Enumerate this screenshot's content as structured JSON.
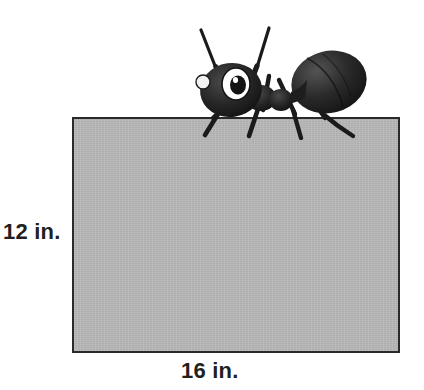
{
  "figure": {
    "name": "ant-on-rectangle-area-problem",
    "background_color": "#ffffff"
  },
  "rectangle": {
    "fill_color": "#b7b7b7",
    "stroke_color": "#2a2a2a",
    "stroke_width_px": 2,
    "x_px": 72,
    "y_px": 117,
    "width_px": 328,
    "height_px": 236
  },
  "labels": {
    "height": "12 in.",
    "width": "16 in.",
    "text_color": "#231f20"
  },
  "ant": {
    "icon_name": "ant-illustration",
    "fill_color": "#1c1c1c",
    "eye_fill": "#ffffff",
    "pupil_fill": "#1c1c1c",
    "facing": "left",
    "parts": [
      "left-antenna",
      "right-antenna",
      "head",
      "eye",
      "thorax",
      "abdomen",
      "front-leg",
      "middle-leg",
      "hind-leg"
    ]
  }
}
